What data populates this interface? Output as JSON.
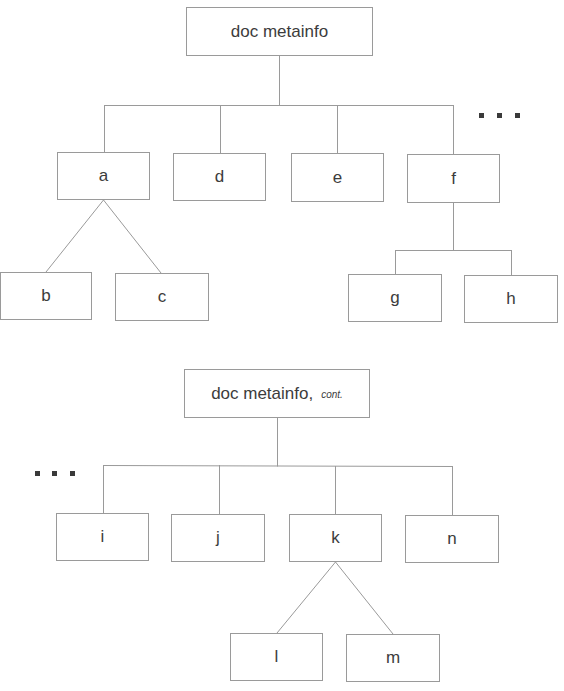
{
  "diagram": {
    "type": "tree",
    "trees": [
      {
        "root": "doc metainfo",
        "root_suffix": "",
        "children": [
          {
            "label": "a",
            "children": [
              "b",
              "c"
            ],
            "connector": "diagonal"
          },
          {
            "label": "d",
            "children": []
          },
          {
            "label": "e",
            "children": []
          },
          {
            "label": "f",
            "children": [
              "g",
              "h"
            ],
            "connector": "orthogonal"
          }
        ],
        "continuation": "right"
      },
      {
        "root": "doc metainfo,",
        "root_suffix": "cont.",
        "children": [
          {
            "label": "i",
            "children": []
          },
          {
            "label": "j",
            "children": []
          },
          {
            "label": "k",
            "children": [
              "l",
              "m"
            ],
            "connector": "diagonal"
          },
          {
            "label": "n",
            "children": []
          }
        ],
        "continuation": "left"
      }
    ],
    "colors": {
      "line": "#9a9a9a",
      "text": "#3c3c3c",
      "dots": "#3a3a3a"
    }
  },
  "labels": {
    "root1": "doc metainfo",
    "root2": "doc metainfo,",
    "root2_suffix": "cont.",
    "a": "a",
    "b": "b",
    "c": "c",
    "d": "d",
    "e": "e",
    "f": "f",
    "g": "g",
    "h": "h",
    "i": "i",
    "j": "j",
    "k": "k",
    "l": "l",
    "m": "m",
    "n": "n"
  }
}
